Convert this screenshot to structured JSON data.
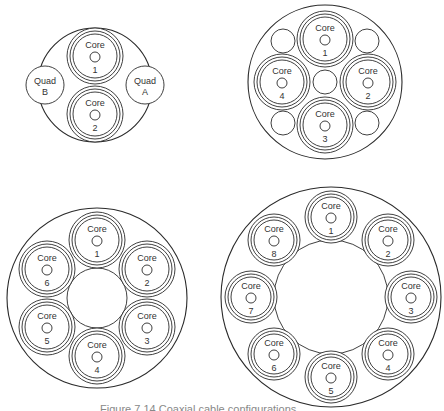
{
  "figure": {
    "caption": "Figure 7.14 Coaxial cable configurations",
    "stroke_color": "#2a2a2a",
    "background": "#ffffff"
  },
  "diagrams": [
    {
      "id": "two-core",
      "outer": {
        "cx": 95,
        "cy": 85,
        "r": 57
      },
      "core_radius": 28,
      "cores": [
        {
          "label": "Core",
          "number": "1",
          "cx": 95,
          "cy": 56
        },
        {
          "label": "Core",
          "number": "2",
          "cx": 95,
          "cy": 114
        }
      ],
      "quads": [
        {
          "label": "Quad",
          "letter": "B",
          "cx": 45,
          "cy": 85,
          "r": 19
        },
        {
          "label": "Quad",
          "letter": "A",
          "cx": 145,
          "cy": 85,
          "r": 19
        }
      ],
      "fillers": []
    },
    {
      "id": "four-core",
      "outer": {
        "cx": 325,
        "cy": 82,
        "r": 77
      },
      "core_radius": 28,
      "cores": [
        {
          "label": "Core",
          "number": "1",
          "cx": 325,
          "cy": 39
        },
        {
          "label": "Core",
          "number": "2",
          "cx": 368,
          "cy": 82
        },
        {
          "label": "Core",
          "number": "3",
          "cx": 325,
          "cy": 125
        },
        {
          "label": "Core",
          "number": "4",
          "cx": 282,
          "cy": 82
        }
      ],
      "quads": [],
      "fillers": [
        {
          "cx": 325,
          "cy": 82,
          "r": 12
        },
        {
          "cx": 283,
          "cy": 41,
          "r": 12
        },
        {
          "cx": 367,
          "cy": 41,
          "r": 12
        },
        {
          "cx": 283,
          "cy": 123,
          "r": 12
        },
        {
          "cx": 367,
          "cy": 123,
          "r": 12
        }
      ]
    },
    {
      "id": "six-core",
      "outer": {
        "cx": 97,
        "cy": 298,
        "r": 90
      },
      "core_radius": 28,
      "cores": [
        {
          "label": "Core",
          "number": "1",
          "cx": 97,
          "cy": 240
        },
        {
          "label": "Core",
          "number": "2",
          "cx": 147,
          "cy": 269
        },
        {
          "label": "Core",
          "number": "3",
          "cx": 147,
          "cy": 327
        },
        {
          "label": "Core",
          "number": "4",
          "cx": 97,
          "cy": 356
        },
        {
          "label": "Core",
          "number": "5",
          "cx": 47,
          "cy": 327
        },
        {
          "label": "Core",
          "number": "6",
          "cx": 47,
          "cy": 269
        }
      ],
      "quads": [],
      "fillers": [
        {
          "cx": 97,
          "cy": 298,
          "r": 30
        }
      ]
    },
    {
      "id": "eight-core",
      "outer": {
        "cx": 331,
        "cy": 297,
        "r": 110
      },
      "core_radius": 26,
      "cores": [
        {
          "label": "Core",
          "number": "1",
          "cx": 331,
          "cy": 217
        },
        {
          "label": "Core",
          "number": "2",
          "cx": 388,
          "cy": 240
        },
        {
          "label": "Core",
          "number": "3",
          "cx": 411,
          "cy": 297
        },
        {
          "label": "Core",
          "number": "4",
          "cx": 388,
          "cy": 354
        },
        {
          "label": "Core",
          "number": "5",
          "cx": 331,
          "cy": 377
        },
        {
          "label": "Core",
          "number": "6",
          "cx": 274,
          "cy": 354
        },
        {
          "label": "Core",
          "number": "7",
          "cx": 251,
          "cy": 297
        },
        {
          "label": "Core",
          "number": "8",
          "cx": 274,
          "cy": 240
        }
      ],
      "quads": [],
      "fillers": [
        {
          "cx": 331,
          "cy": 297,
          "r": 57
        }
      ]
    }
  ]
}
